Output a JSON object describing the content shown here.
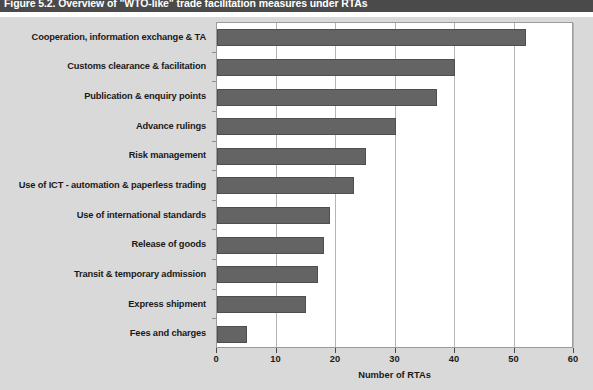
{
  "figure": {
    "title": "Figure 5.2. Overview of \"WTO-like\" trade facilitation measures under RTAs",
    "background_color": "#d9d9d9",
    "plot_background_color": "#ffffff",
    "bar_color": "#646464",
    "title_banner_color": "#4a4a4a"
  },
  "chart_data": {
    "type": "bar",
    "orientation": "horizontal",
    "title": "Figure 5.2. Overview of \"WTO-like\" trade facilitation measures under RTAs",
    "xlabel": "Number of RTAs",
    "ylabel": "",
    "xlim": [
      0,
      60
    ],
    "xticks": [
      0,
      10,
      20,
      30,
      40,
      50,
      60
    ],
    "xtick_labels": [
      "0",
      "10",
      "20",
      "30",
      "40",
      "50",
      "60"
    ],
    "grid": "vertical",
    "legend": "none",
    "categories": [
      "Cooperation, information exchange & TA",
      "Customs clearance & facilitation",
      "Publication & enquiry points",
      "Advance rulings",
      "Risk management",
      "Use of ICT - automation & paperless trading",
      "Use of international standards",
      "Release of goods",
      "Transit & temporary admission",
      "Express shipment",
      "Fees and charges"
    ],
    "values": [
      52,
      40,
      37,
      30,
      25,
      23,
      19,
      18,
      17,
      15,
      5
    ]
  }
}
